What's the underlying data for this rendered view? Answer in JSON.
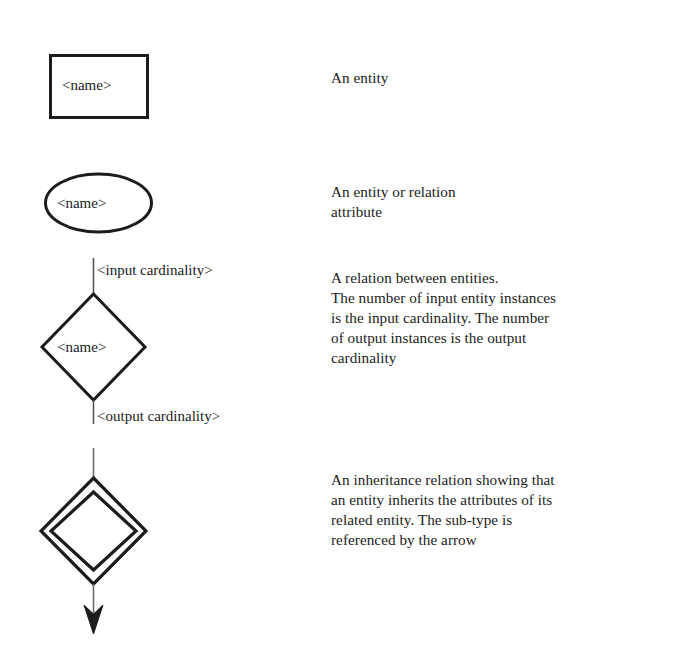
{
  "page": {
    "background_color": "#ffffff",
    "ink_color": "#1c1c1c"
  },
  "legend": {
    "rows": [
      {
        "key": "entity",
        "symbol": "rectangle",
        "label": "<name>",
        "description": "An entity"
      },
      {
        "key": "attribute",
        "symbol": "ellipse",
        "label": "<name>",
        "description": "An entity or relation\nattribute"
      },
      {
        "key": "relation",
        "symbol": "diamond",
        "label": "<name>",
        "input_label": "<input cardinality>",
        "output_label": "<output cardinality>",
        "description": "A relation between entities.\nThe number of input entity instances\nis the input cardinality.  The number\nof output instances is the output\ncardinality"
      },
      {
        "key": "inheritance",
        "symbol": "double-diamond-with-arrow",
        "description": "An inheritance relation showing that\nan entity inherits the attributes of its\nrelated entity.  The sub-type is\nreferenced by the arrow"
      }
    ]
  }
}
